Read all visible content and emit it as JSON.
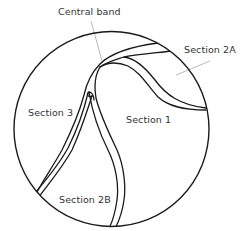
{
  "diagram": {
    "type": "circular cross-section with dividing bands",
    "colors": {
      "stroke": "#1a1a1a",
      "leader": "#9a9a9a",
      "text": "#333333",
      "background": "#ffffff"
    },
    "labels": {
      "central_band": "Central band",
      "section_2a": "Section 2A",
      "section_3": "Section 3",
      "section_1": "Section 1",
      "section_2b": "Section 2B"
    }
  }
}
